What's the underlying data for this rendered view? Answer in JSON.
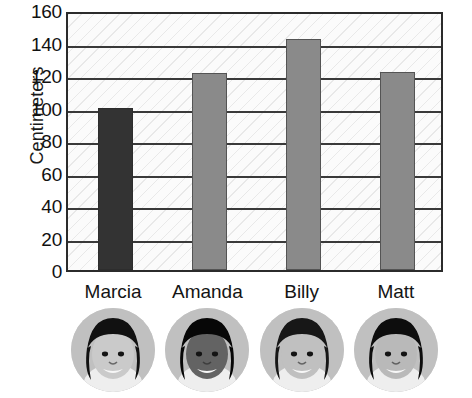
{
  "chart_data": {
    "type": "bar",
    "title": "",
    "xlabel": "",
    "ylabel": "Centimeters",
    "categories": [
      "Marcia",
      "Amanda",
      "Billy",
      "Matt"
    ],
    "values": [
      100,
      121,
      142,
      122
    ],
    "ylim": [
      0,
      160
    ],
    "ytick_step": 20,
    "yticks": [
      160,
      140,
      120,
      100,
      80,
      60,
      40,
      20,
      0
    ],
    "grid": true,
    "legend": "none",
    "bar_colors": [
      "#333333",
      "#8a8a8a",
      "#8a8a8a",
      "#8a8a8a"
    ],
    "units": "cm"
  },
  "axis": {
    "y_title": "Centimeters",
    "tick_labels": [
      "160",
      "140",
      "120",
      "100",
      "80",
      "60",
      "40",
      "20",
      "0"
    ]
  },
  "bars": [
    {
      "name": "Marcia",
      "value": 100,
      "color": "#333333"
    },
    {
      "name": "Amanda",
      "value": 121,
      "color": "#8a8a8a"
    },
    {
      "name": "Billy",
      "value": 142,
      "color": "#8a8a8a"
    },
    {
      "name": "Matt",
      "value": 122,
      "color": "#8a8a8a"
    }
  ],
  "photos": [
    {
      "alt": "Marcia portrait",
      "icon": "child-portrait-photo"
    },
    {
      "alt": "Amanda portrait",
      "icon": "child-portrait-photo"
    },
    {
      "alt": "Billy portrait",
      "icon": "child-portrait-photo"
    },
    {
      "alt": "Matt portrait",
      "icon": "child-portrait-photo"
    }
  ],
  "style": {
    "plot_bg": "#fbfbfb",
    "frame_color": "#2b2b2b",
    "gridline_color": "#3a3a3a",
    "text_color": "#111111"
  }
}
